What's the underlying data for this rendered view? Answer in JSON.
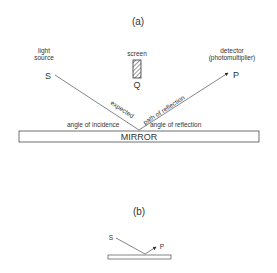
{
  "panel_a": {
    "label": "(a)",
    "light_source_line1": "light",
    "light_source_line2": "source",
    "source_point": "S",
    "screen_label": "screen",
    "screen_point": "Q",
    "detector_line1": "detector",
    "detector_line2": "(photomultiplier)",
    "detector_point": "P",
    "path_label_1": "expected",
    "path_label_2": "path of reflection",
    "angle_incidence": "angle of incidence",
    "angle_reflection": "angle of reflection",
    "mirror_label": "MIRROR"
  },
  "panel_b": {
    "label": "(b)",
    "source_point": "S",
    "detector_point": "P"
  },
  "colors": {
    "ink": "#333333",
    "background": "#ffffff"
  }
}
